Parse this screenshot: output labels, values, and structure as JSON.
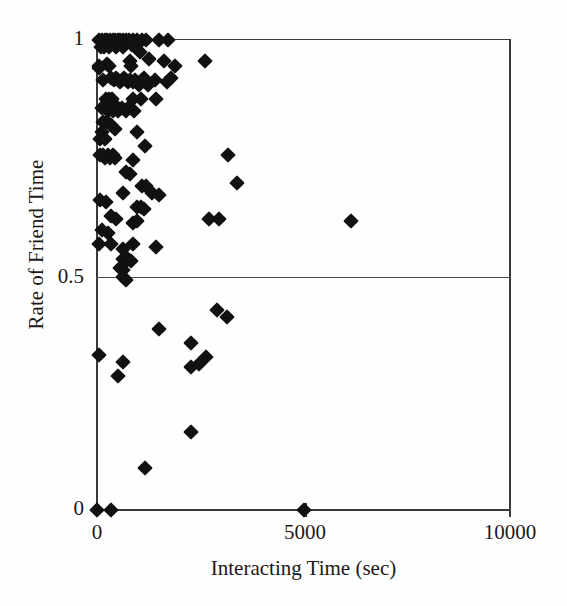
{
  "chart_data": {
    "type": "scatter",
    "title": "",
    "xlabel": "Interacting Time (sec)",
    "ylabel": "Rate of Friend Time",
    "xlim": [
      0,
      10000
    ],
    "ylim": [
      0,
      1
    ],
    "xticks": [
      0,
      5000,
      10000
    ],
    "xticklabels": [
      "0",
      "5000",
      "10000"
    ],
    "yticks": [
      0,
      0.5,
      1
    ],
    "yticklabels": [
      "0",
      "0.5",
      "1"
    ],
    "grid": "horizontal-line-at-0.5",
    "marker": "filled-diamond",
    "marker_color": "#111111",
    "frame_color": "#3a3a3a",
    "series": [
      {
        "name": "participants",
        "points": [
          [
            60,
            1.0
          ],
          [
            130,
            1.0
          ],
          [
            200,
            1.0
          ],
          [
            250,
            1.0
          ],
          [
            320,
            1.0
          ],
          [
            390,
            1.0
          ],
          [
            430,
            1.0
          ],
          [
            500,
            1.0
          ],
          [
            560,
            1.0
          ],
          [
            640,
            1.0
          ],
          [
            700,
            1.0
          ],
          [
            780,
            1.0
          ],
          [
            860,
            1.0
          ],
          [
            960,
            1.0
          ],
          [
            1080,
            1.0
          ],
          [
            1180,
            1.0
          ],
          [
            1500,
            1.0
          ],
          [
            1720,
            1.0
          ],
          [
            90,
            0.985
          ],
          [
            170,
            0.985
          ],
          [
            300,
            0.985
          ],
          [
            470,
            0.985
          ],
          [
            620,
            0.985
          ],
          [
            850,
            0.99
          ],
          [
            1030,
            0.975
          ],
          [
            40,
            0.945
          ],
          [
            60,
            0.94
          ],
          [
            230,
            0.95
          ],
          [
            280,
            0.945
          ],
          [
            790,
            0.955
          ],
          [
            820,
            0.945
          ],
          [
            1260,
            0.96
          ],
          [
            1620,
            0.955
          ],
          [
            1880,
            0.945
          ],
          [
            2610,
            0.955
          ],
          [
            150,
            0.915
          ],
          [
            330,
            0.92
          ],
          [
            400,
            0.915
          ],
          [
            460,
            0.92
          ],
          [
            520,
            0.915
          ],
          [
            560,
            0.91
          ],
          [
            600,
            0.915
          ],
          [
            660,
            0.92
          ],
          [
            700,
            0.915
          ],
          [
            750,
            0.91
          ],
          [
            800,
            0.915
          ],
          [
            860,
            0.91
          ],
          [
            910,
            0.915
          ],
          [
            1010,
            0.905
          ],
          [
            1080,
            0.915
          ],
          [
            1140,
            0.92
          ],
          [
            1230,
            0.905
          ],
          [
            1400,
            0.915
          ],
          [
            1690,
            0.91
          ],
          [
            1800,
            0.92
          ],
          [
            210,
            0.875
          ],
          [
            300,
            0.875
          ],
          [
            360,
            0.875
          ],
          [
            880,
            0.875
          ],
          [
            1070,
            0.875
          ],
          [
            1420,
            0.875
          ],
          [
            120,
            0.855
          ],
          [
            180,
            0.86
          ],
          [
            240,
            0.855
          ],
          [
            270,
            0.85
          ],
          [
            320,
            0.855
          ],
          [
            380,
            0.85
          ],
          [
            430,
            0.855
          ],
          [
            470,
            0.86
          ],
          [
            520,
            0.85
          ],
          [
            600,
            0.855
          ],
          [
            690,
            0.85
          ],
          [
            760,
            0.855
          ],
          [
            900,
            0.85
          ],
          [
            150,
            0.825
          ],
          [
            250,
            0.825
          ],
          [
            350,
            0.82
          ],
          [
            110,
            0.805
          ],
          [
            430,
            0.81
          ],
          [
            960,
            0.805
          ],
          [
            70,
            0.79
          ],
          [
            200,
            0.79
          ],
          [
            1150,
            0.775
          ],
          [
            80,
            0.755
          ],
          [
            140,
            0.755
          ],
          [
            200,
            0.75
          ],
          [
            260,
            0.755
          ],
          [
            320,
            0.75
          ],
          [
            380,
            0.755
          ],
          [
            430,
            0.75
          ],
          [
            870,
            0.745
          ],
          [
            3160,
            0.755
          ],
          [
            700,
            0.72
          ],
          [
            790,
            0.715
          ],
          [
            1080,
            0.69
          ],
          [
            1180,
            0.69
          ],
          [
            3400,
            0.695
          ],
          [
            620,
            0.675
          ],
          [
            1330,
            0.675
          ],
          [
            1490,
            0.67
          ],
          [
            70,
            0.66
          ],
          [
            210,
            0.655
          ],
          [
            980,
            0.645
          ],
          [
            1070,
            0.645
          ],
          [
            1140,
            0.64
          ],
          [
            330,
            0.625
          ],
          [
            450,
            0.62
          ],
          [
            880,
            0.61
          ],
          [
            960,
            0.615
          ],
          [
            120,
            0.595
          ],
          [
            260,
            0.59
          ],
          [
            6140,
            0.615
          ],
          [
            2700,
            0.62
          ],
          [
            2950,
            0.62
          ],
          [
            40,
            0.565
          ],
          [
            350,
            0.565
          ],
          [
            620,
            0.555
          ],
          [
            880,
            0.565
          ],
          [
            1420,
            0.56
          ],
          [
            640,
            0.535
          ],
          [
            700,
            0.53
          ],
          [
            760,
            0.535
          ],
          [
            830,
            0.53
          ],
          [
            560,
            0.515
          ],
          [
            620,
            0.51
          ],
          [
            620,
            0.495
          ],
          [
            700,
            0.49
          ],
          [
            2900,
            0.425
          ],
          [
            3150,
            0.41
          ],
          [
            1490,
            0.385
          ],
          [
            2270,
            0.355
          ],
          [
            2270,
            0.305
          ],
          [
            2480,
            0.31
          ],
          [
            2630,
            0.325
          ],
          [
            40,
            0.33
          ],
          [
            620,
            0.315
          ],
          [
            520,
            0.285
          ],
          [
            2270,
            0.165
          ],
          [
            1170,
            0.09
          ],
          [
            0,
            0.0
          ],
          [
            350,
            0.0
          ],
          [
            5000,
            0.0
          ]
        ]
      }
    ]
  },
  "axes": {
    "yticklabel_1": "1",
    "yticklabel_half": "0.5",
    "yticklabel_0": "0",
    "xticklabel_0": "0",
    "xticklabel_5000": "5000",
    "xticklabel_10000": "10000"
  }
}
